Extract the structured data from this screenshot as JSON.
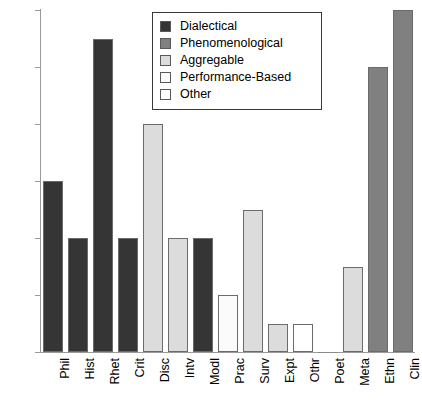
{
  "chart_data": {
    "type": "bar",
    "title": "",
    "xlabel": "",
    "ylabel": "",
    "ylim": [
      0,
      12
    ],
    "yticks": [
      0,
      2,
      4,
      6,
      8,
      10,
      12
    ],
    "grid": false,
    "legend_position": "top-center",
    "categories": [
      "Phil",
      "Hist",
      "Rhet",
      "Crit",
      "Disc",
      "Intv",
      "Modl",
      "Prac",
      "Surv",
      "Expt",
      "Othr",
      "Poet",
      "Meta",
      "Ethn",
      "Clin"
    ],
    "values": [
      6,
      4,
      11,
      4,
      8,
      4,
      4,
      2,
      5,
      1,
      1,
      0,
      3,
      10,
      12
    ],
    "bar_groups": [
      "Dialectical",
      "Dialectical",
      "Dialectical",
      "Dialectical",
      "Aggregable",
      "Aggregable",
      "Dialectical",
      "Performance-Based",
      "Aggregable",
      "Aggregable",
      "Other",
      "Other",
      "Aggregable",
      "Phenomenological",
      "Phenomenological"
    ],
    "bar_colors": [
      "#353535",
      "#353535",
      "#353535",
      "#353535",
      "#dcdcdc",
      "#dcdcdc",
      "#353535",
      "#fbfbfb",
      "#dcdcdc",
      "#dcdcdc",
      "#ffffff",
      "#ffffff",
      "#dcdcdc",
      "#808080",
      "#808080"
    ],
    "legend": [
      {
        "label": "Dialectical",
        "color": "#353535"
      },
      {
        "label": "Phenomenological",
        "color": "#808080"
      },
      {
        "label": "Aggregable",
        "color": "#dcdcdc"
      },
      {
        "label": "Performance-Based",
        "color": "#fbfbfb"
      },
      {
        "label": "Other",
        "color": "#ffffff"
      }
    ]
  },
  "axis": {
    "tick_labels": [
      "0",
      "2",
      "4",
      "6",
      "8",
      "10",
      "12"
    ]
  },
  "colors": {
    "dialectical": "#353535",
    "phenomenological": "#808080",
    "aggregable": "#dcdcdc",
    "performance_based": "#fbfbfb",
    "other": "#ffffff",
    "axis": "#9a9a9a",
    "bar_edge": "#6b6b6b",
    "legend_border": "#3a3a3a",
    "background": "#ffffff"
  }
}
